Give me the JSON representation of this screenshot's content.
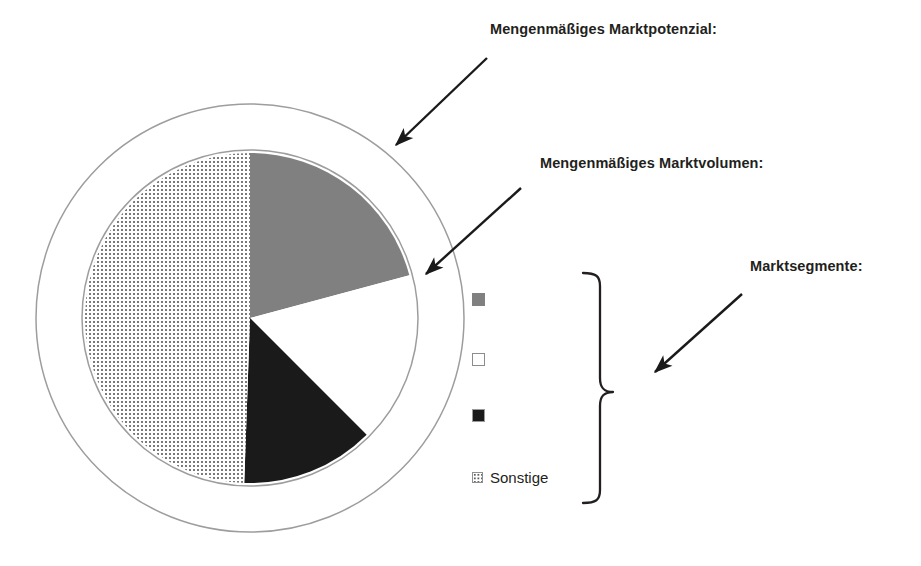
{
  "figure": {
    "background_color": "#ffffff",
    "width": 921,
    "height": 566
  },
  "annotations": {
    "potenzial_label": "Mengenmäßiges Marktpotenzial:",
    "volumen_label": "Mengenmäßiges Marktvolumen:",
    "segmente_label": "Marktsegmente:",
    "arrow_color": "#1a1a1a",
    "brace_color": "#231f20"
  },
  "legend": {
    "items": [
      {
        "marker": "filled-gray-square",
        "color": "#808080",
        "label": ""
      },
      {
        "marker": "outlined-white-square",
        "color": "#ffffff",
        "label": ""
      },
      {
        "marker": "filled-black-square",
        "color": "#1a1a1a",
        "label": ""
      },
      {
        "marker": "dotted-pattern-square",
        "color": "#ffffff",
        "label": "Sonstige"
      }
    ]
  },
  "chart_data": {
    "type": "pie",
    "title": "",
    "subtitle": "",
    "xlabel": "",
    "ylabel": "",
    "legend_position": "right",
    "grid": false,
    "center": {
      "x": 250,
      "y": 318
    },
    "pie_radius": 165,
    "rings": [
      {
        "name": "marktvolumen-boundary",
        "radius": 168,
        "stroke": "#9a9a9a",
        "stroke_width": 1.4
      },
      {
        "name": "marktpotenzial-boundary",
        "radius": 214,
        "stroke": "#9a9a9a",
        "stroke_width": 1.4
      }
    ],
    "start_angle_deg": 0,
    "direction": "clockwise",
    "categories": [
      "Segment 1",
      "Segment 2",
      "Segment 3",
      "Sonstige"
    ],
    "values": [
      20.8,
      16.7,
      13.1,
      49.4
    ],
    "slices": [
      {
        "name": "Segment 1",
        "fill": "#808080",
        "pattern": "solid",
        "start_deg": 0,
        "end_deg": 75,
        "value": 20.8
      },
      {
        "name": "Segment 2",
        "fill": "#ffffff",
        "pattern": "solid",
        "start_deg": 75,
        "end_deg": 135,
        "value": 16.7
      },
      {
        "name": "Segment 3",
        "fill": "#1a1a1a",
        "pattern": "solid",
        "start_deg": 135,
        "end_deg": 182,
        "value": 13.1
      },
      {
        "name": "Sonstige",
        "fill": "#ffffff",
        "pattern": "dots",
        "start_deg": 182,
        "end_deg": 360,
        "value": 49.4
      }
    ],
    "annotation_targets": [
      {
        "label": "Mengenmäßiges Marktpotenzial:",
        "points_to": "outer-ring"
      },
      {
        "label": "Mengenmäßiges Marktvolumen:",
        "points_to": "pie-circle-edge"
      },
      {
        "label": "Marktsegmente:",
        "points_to": "legend-brace"
      }
    ]
  }
}
